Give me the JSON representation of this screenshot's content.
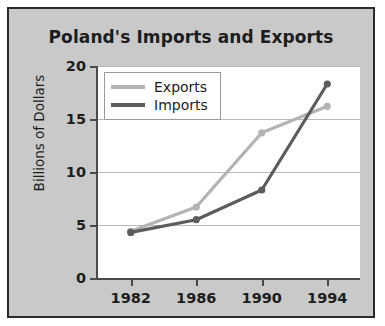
{
  "chart_data": {
    "type": "line",
    "title": "Poland's Imports and Exports",
    "xlabel": "",
    "ylabel": "Billions of Dollars",
    "categories": [
      "1982",
      "1986",
      "1990",
      "1994"
    ],
    "x": [
      1982,
      1986,
      1990,
      1994
    ],
    "xlim": [
      1980,
      1996
    ],
    "ylim": [
      0,
      20
    ],
    "yticks": [
      0,
      5,
      10,
      15,
      20
    ],
    "ytick_labels": [
      "0",
      "5",
      "10",
      "15",
      "20"
    ],
    "xticks": [
      1982,
      1986,
      1990,
      1994
    ],
    "xtick_labels": [
      "1982",
      "1986",
      "1990",
      "1994"
    ],
    "grid": "horizontal",
    "legend_position": "top-left",
    "markers": "circle",
    "series": [
      {
        "name": "Exports",
        "color": "#b3b3b3",
        "values": [
          4.4,
          6.7,
          13.7,
          16.2
        ]
      },
      {
        "name": "Imports",
        "color": "#5c5c5c",
        "values": [
          4.3,
          5.5,
          8.3,
          18.3
        ]
      }
    ]
  },
  "legend": {
    "items": [
      {
        "label": "Exports",
        "color": "#b3b3b3"
      },
      {
        "label": "Imports",
        "color": "#5c5c5c"
      }
    ]
  },
  "colors": {
    "figure_background": "#c9c9c9",
    "plot_background": "#ffffff",
    "frame": "#2b2b2b",
    "axis": "#4a4a4a",
    "gridline": "#b9b9b9",
    "text": "#1d1d1d",
    "exports": "#b3b3b3",
    "imports": "#5c5c5c"
  }
}
